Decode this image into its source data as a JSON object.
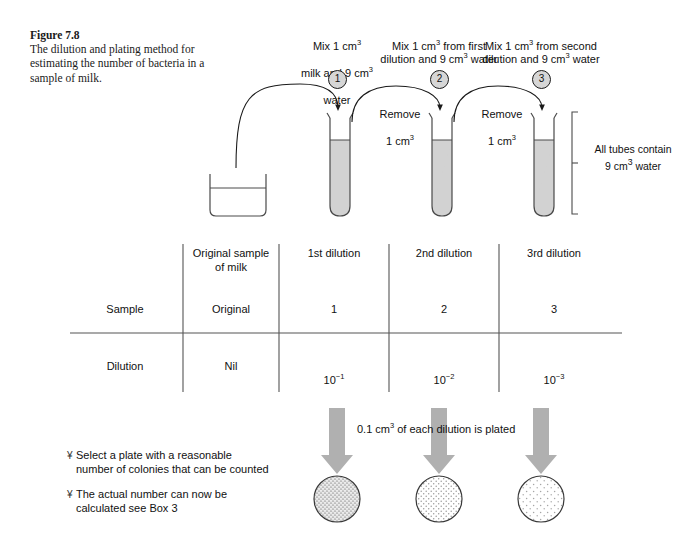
{
  "figure": {
    "caption_title": "Figure 7.8",
    "caption_body": "The dilution and plating method for estimating the number of bacteria in a sample of milk."
  },
  "steps": [
    {
      "number": "1",
      "mix_line1": "Mix 1 cm",
      "mix_sup1": "3",
      "mix_line2": "milk and 9 cm",
      "mix_sup2": "3",
      "mix_line3": "water",
      "label_full": "Mix 1 cm3 milk and 9 cm3 water"
    },
    {
      "number": "2",
      "mix_line1": "Mix 1 cm",
      "mix_sup1": "3",
      "mix_line2": " from first dilution and 9 cm",
      "mix_sup2": "3",
      "mix_line3": " water",
      "label_full": "Mix 1 cm3 from first dilution and 9 cm3 water"
    },
    {
      "number": "3",
      "mix_line1": "Mix 1 cm",
      "mix_sup1": "3",
      "mix_line2": " from second dilution and 9 cm",
      "mix_sup2": "3",
      "mix_line3": " water",
      "label_full": "Mix 1 cm3 from second dilution and 9 cm3 water"
    }
  ],
  "transfer_labels": [
    {
      "line1": "Remove",
      "line2": "1 cm",
      "sup": "3"
    },
    {
      "line1": "Remove",
      "line2": "1 cm",
      "sup": "3"
    }
  ],
  "tubes_note": {
    "line1": "All tubes contain",
    "line2": "9 cm",
    "sup": "3",
    "line3": " water"
  },
  "table": {
    "column_headers": [
      "",
      "Original sample\nof milk",
      "1st dilution",
      "2nd dilution",
      "3rd dilution"
    ],
    "rows": [
      {
        "label": "Sample",
        "values": [
          "Original",
          "1",
          "2",
          "3"
        ]
      },
      {
        "label": "Dilution",
        "values_base": [
          "Nil",
          "10",
          "10",
          "10"
        ],
        "values_sup": [
          "",
          "−1",
          "−2",
          "−3"
        ],
        "values_plain": [
          "Nil",
          "10−1",
          "10−2",
          "10−3"
        ]
      }
    ]
  },
  "plating": {
    "note_pre": "0.1 cm",
    "note_sup": "3",
    "note_post": " of each dilution is plated",
    "note_full": "0.1 cm3 of each dilution is plated",
    "plates": [
      {
        "name": "plate-1st-dilution",
        "density": "dense"
      },
      {
        "name": "plate-2nd-dilution",
        "density": "medium"
      },
      {
        "name": "plate-3rd-dilution",
        "density": "sparse"
      }
    ]
  },
  "annotations": [
    {
      "bullet": "¥",
      "line1": "Select a plate with a reasonable",
      "line2": "number of colonies that can be counted"
    },
    {
      "bullet": "¥",
      "line1": "The actual number can now be",
      "line2": "calculated see Box 3"
    }
  ],
  "colors": {
    "ink": "#111111",
    "line": "#4a4a4a",
    "tube_fill": "#d2d2d2",
    "arrow_gray": "#b0b0b0",
    "circle_fill": "#d6d6d6",
    "plate_outline": "#3a3a3a"
  }
}
